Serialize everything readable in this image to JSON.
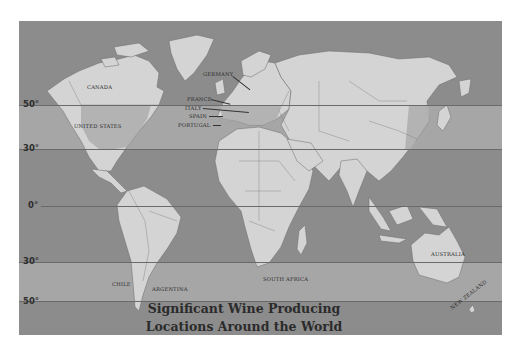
{
  "map": {
    "title_line1": "Significant Wine Producing",
    "title_line2": "Locations Around the World",
    "colors": {
      "ocean": "#8c8c8c",
      "wine_band": "#a6a6a6",
      "land": "#d4d4d4",
      "highlight_region": "#b0b0b0",
      "border": "#6a6a6a"
    },
    "latitudes": [
      {
        "label": "50°",
        "y": 84
      },
      {
        "label": "30°",
        "y": 128
      },
      {
        "label": "0°",
        "y": 185
      },
      {
        "label": "30°",
        "y": 241
      },
      {
        "label": "50°",
        "y": 280
      }
    ],
    "countries": [
      {
        "name": "CANADA",
        "x": 68,
        "y": 66
      },
      {
        "name": "UNITED STATES",
        "x": 57,
        "y": 104
      },
      {
        "name": "GERMANY",
        "x": 185,
        "y": 52
      },
      {
        "name": "FRANCE",
        "x": 168,
        "y": 77
      },
      {
        "name": "ITALY",
        "x": 166,
        "y": 86
      },
      {
        "name": "SPAIN",
        "x": 170,
        "y": 94
      },
      {
        "name": "PORTUGAL",
        "x": 160,
        "y": 102
      },
      {
        "name": "CHILE",
        "x": 93,
        "y": 262
      },
      {
        "name": "ARGENTINA",
        "x": 133,
        "y": 266
      },
      {
        "name": "SOUTH AFRICA",
        "x": 244,
        "y": 254
      },
      {
        "name": "AUSTRALIA",
        "x": 412,
        "y": 231
      },
      {
        "name": "NEW ZEALAND",
        "x": 437,
        "y": 285
      }
    ]
  }
}
